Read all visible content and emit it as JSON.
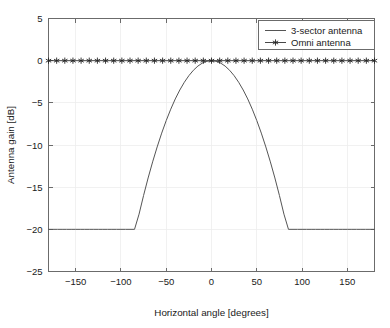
{
  "chart_data": {
    "type": "line",
    "title": "",
    "xlabel": "Horizontal angle [degrees]",
    "ylabel": "Antenna gain [dB]",
    "xlim": [
      -180,
      180
    ],
    "ylim": [
      -25,
      5
    ],
    "xticks": [
      -150,
      -100,
      -50,
      0,
      50,
      100,
      150
    ],
    "xticklabels": [
      "−150",
      "−100",
      "−50",
      "0",
      "50",
      "100",
      "150"
    ],
    "yticks": [
      5,
      0,
      -5,
      -10,
      -15,
      -20,
      -25
    ],
    "yticklabels": [
      "5",
      "0",
      "−5",
      "−10",
      "−15",
      "−20",
      "−25"
    ],
    "grid": true,
    "legend_position": "upper right",
    "series": [
      {
        "name": "3-sector antenna",
        "style": "line",
        "color": "#555555",
        "description": "Parabolic main lobe, -12*(theta/65)^2 dB, floored at -20 dB",
        "x": [
          -180,
          -175,
          -170,
          -165,
          -160,
          -155,
          -150,
          -145,
          -140,
          -135,
          -130,
          -125,
          -120,
          -115,
          -110,
          -105,
          -100,
          -95,
          -90,
          -85,
          -80,
          -75,
          -70,
          -65,
          -60,
          -55,
          -50,
          -45,
          -40,
          -35,
          -30,
          -25,
          -20,
          -15,
          -10,
          -5,
          0,
          5,
          10,
          15,
          20,
          25,
          30,
          35,
          40,
          45,
          50,
          55,
          60,
          65,
          70,
          75,
          80,
          85,
          90,
          95,
          100,
          105,
          110,
          115,
          120,
          125,
          130,
          135,
          140,
          145,
          150,
          155,
          160,
          165,
          170,
          175,
          180
        ],
        "y": [
          -20,
          -20,
          -20,
          -20,
          -20,
          -20,
          -20,
          -20,
          -20,
          -20,
          -20,
          -20,
          -20,
          -20,
          -20,
          -20,
          -20,
          -20,
          -20,
          -20.0,
          -18.2,
          -15.98,
          -13.91,
          -12.0,
          -10.23,
          -8.59,
          -7.1,
          -5.75,
          -4.54,
          -3.48,
          -2.56,
          -1.78,
          -1.14,
          -0.64,
          -0.28,
          -0.07,
          0,
          -0.07,
          -0.28,
          -0.64,
          -1.14,
          -1.78,
          -2.56,
          -3.48,
          -4.54,
          -5.75,
          -7.1,
          -8.59,
          -10.23,
          -12.0,
          -13.91,
          -15.98,
          -18.2,
          -20.0,
          -20,
          -20,
          -20,
          -20,
          -20,
          -20,
          -20,
          -20,
          -20,
          -20,
          -20,
          -20,
          -20,
          -20,
          -20,
          -20,
          -20,
          -20,
          -20
        ]
      },
      {
        "name": "Omni antenna",
        "style": "line-with-star-markers",
        "color": "#333333",
        "description": "Constant 0 dB across all angles",
        "x": [
          -180,
          -171,
          -162,
          -153,
          -144,
          -135,
          -126,
          -117,
          -108,
          -99,
          -90,
          -81,
          -72,
          -63,
          -54,
          -45,
          -36,
          -27,
          -18,
          -9,
          0,
          9,
          18,
          27,
          36,
          45,
          54,
          63,
          72,
          81,
          90,
          99,
          108,
          117,
          126,
          135,
          144,
          153,
          162,
          171,
          180
        ],
        "y": [
          0,
          0,
          0,
          0,
          0,
          0,
          0,
          0,
          0,
          0,
          0,
          0,
          0,
          0,
          0,
          0,
          0,
          0,
          0,
          0,
          0,
          0,
          0,
          0,
          0,
          0,
          0,
          0,
          0,
          0,
          0,
          0,
          0,
          0,
          0,
          0,
          0,
          0,
          0,
          0,
          0
        ]
      }
    ],
    "legend": [
      {
        "label": "3-sector antenna",
        "marker": "none"
      },
      {
        "label": "Omni antenna",
        "marker": "star"
      }
    ]
  },
  "colors": {
    "background": "#ffffff",
    "axis": "#6b6b6b",
    "grid": "#eeeeee",
    "sector_series": "#555555",
    "omni_series": "#333333",
    "text": "#1a1a1a"
  }
}
